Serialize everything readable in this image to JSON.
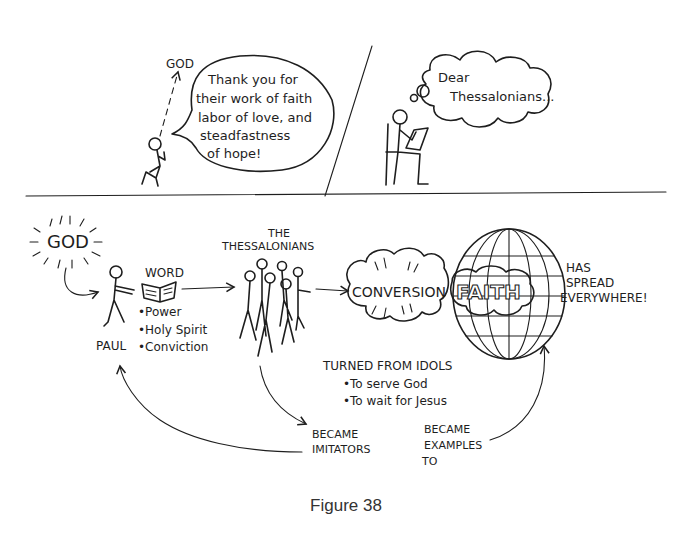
{
  "panel_top_left": {
    "god_label": "GOD",
    "speech_lines": [
      "Thank you for",
      "their work of faith",
      "labor of love, and",
      "steadfastness",
      "of hope!"
    ]
  },
  "panel_top_right": {
    "thought_lines": [
      "Dear",
      "Thessalonians..."
    ]
  },
  "lower_diagram": {
    "god_label": "GOD",
    "paul_label": "PAUL",
    "word_label": "WORD",
    "word_bullets": [
      "•Power",
      "•Holy Spirit",
      "•Conviction"
    ],
    "thessalonians_label": [
      "THE",
      "THESSALONIANS"
    ],
    "conversion_label": "CONVERSION",
    "faith_label": "FAITH",
    "spread_lines": [
      "HAS",
      "SPREAD",
      "EVERYWHERE!"
    ],
    "turned_title": "TURNED FROM IDOLS",
    "turned_bullets": [
      "•To serve God",
      "•To wait for Jesus"
    ],
    "imitators_lines": [
      "BECAME",
      "IMITATORS"
    ],
    "examples_lines": [
      "BECAME",
      "EXAMPLES",
      "TO"
    ]
  },
  "caption": "Figure 38"
}
